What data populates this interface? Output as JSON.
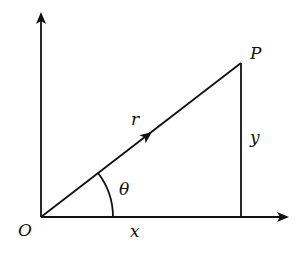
{
  "diagram": {
    "type": "polar-coordinates",
    "labels": {
      "origin": "O",
      "point": "P",
      "radius": "r",
      "angle": "θ",
      "x_component": "x",
      "y_component": "y"
    },
    "colors": {
      "stroke": "#111111",
      "background": "#ffffff"
    }
  }
}
